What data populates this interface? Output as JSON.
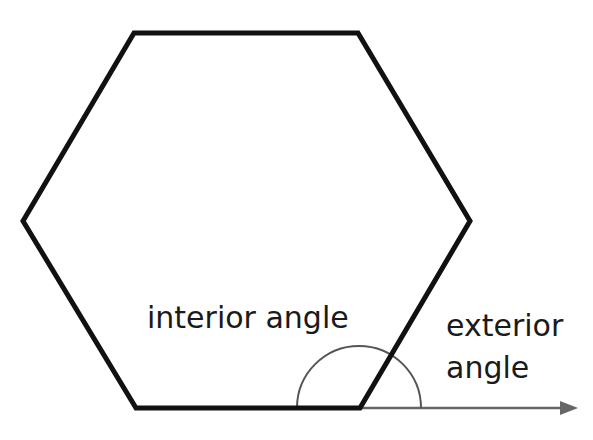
{
  "diagram": {
    "shape": "regular hexagon",
    "colors": {
      "outline": "#111111",
      "arc": "#555555",
      "arrow": "#666666",
      "text": "#1a1a1a",
      "background": "#ffffff"
    },
    "hexagon_vertices": [
      [
        134,
        33
      ],
      [
        358,
        33
      ],
      [
        470,
        221
      ],
      [
        360,
        408
      ],
      [
        136,
        408
      ],
      [
        23,
        221
      ]
    ],
    "angle_vertex": [
      359,
      408
    ],
    "arc_radius": 62,
    "extension_arrow": {
      "from": [
        360,
        408
      ],
      "to": [
        577,
        408
      ]
    },
    "labels": {
      "interior": "interior angle",
      "exterior_line1": "exterior",
      "exterior_line2": "angle"
    }
  }
}
